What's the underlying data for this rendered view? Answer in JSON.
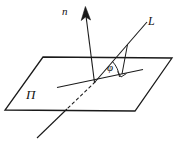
{
  "figure": {
    "type": "geometry-diagram",
    "background_color": "#ffffff",
    "stroke_color": "#1a1a1a",
    "labels": {
      "normal_vector": "n",
      "line": "L",
      "angle": "φ",
      "plane": "Π"
    },
    "elements": {
      "plane_name": "plane-parallelogram",
      "normal_name": "normal-vector-arrow",
      "line_name": "line-L",
      "projection_name": "projection-line",
      "hidden_name": "hidden-line-dashed",
      "angle_arc_name": "angle-arc",
      "right_angle_name": "right-angle-marker"
    },
    "geometry": {
      "plane_points": "43,57 172,58 135,111 5,110",
      "normal_line": {
        "x1": 95,
        "y1": 82,
        "x2": 86,
        "y2": 14
      },
      "normal_arrow": "86,8 82,19 86,16 91,19",
      "line_L": {
        "x1": 95,
        "y1": 82,
        "x2": 146,
        "y2": 23
      },
      "projection_line": {
        "x1": 58,
        "y1": 87,
        "x2": 143,
        "y2": 70
      },
      "perp_drop": {
        "x1": 127,
        "y1": 45,
        "x2": 122,
        "y2": 74
      },
      "right_angle": "118,70 121,75 126,72",
      "angle_arc": "M 118,76 A 26,26 0 0 0 112,62",
      "hidden_dash": {
        "x1": 95,
        "y1": 82,
        "x2": 67,
        "y2": 109
      },
      "hidden_solid": {
        "x1": 67,
        "y1": 109,
        "x2": 37,
        "y2": 138
      }
    }
  }
}
